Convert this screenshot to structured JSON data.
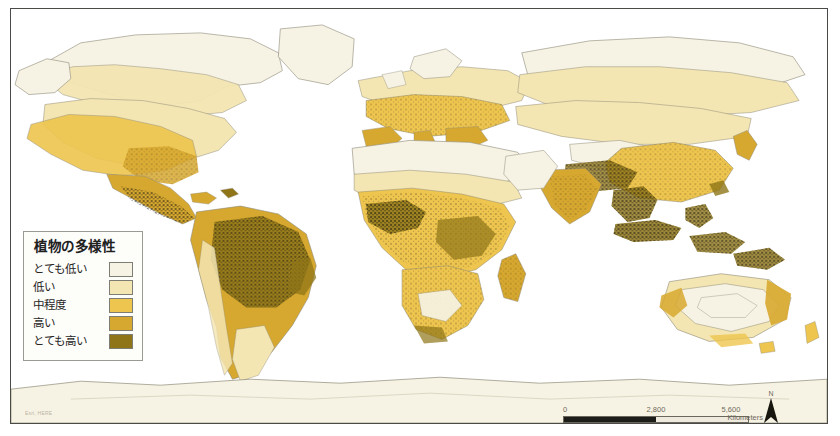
{
  "map": {
    "title": "World Plant Diversity Map",
    "ocean_color": "#ffffff",
    "frame_color": "#4a4a46",
    "coastline_color": "#8d8a78",
    "speckle_color": "#2a2517"
  },
  "legend": {
    "title": "植物の多様性",
    "items": [
      {
        "label": "とても低い",
        "color": "#f7f3e4"
      },
      {
        "label": "低い",
        "color": "#f4e6b2"
      },
      {
        "label": "中程度",
        "color": "#eec54e"
      },
      {
        "label": "高い",
        "color": "#d7a82f"
      },
      {
        "label": "とても高い",
        "color": "#8f7518"
      }
    ]
  },
  "scalebar": {
    "ticks": [
      "0",
      "2,800",
      "5,600"
    ],
    "unit": "Kilometers"
  },
  "north_arrow": {
    "label": "N"
  },
  "credit": {
    "text": "Esri, HERE"
  },
  "regions": {
    "very_low": "#f7f3e4",
    "low": "#f4e6b2",
    "medium": "#eec54e",
    "high": "#d7a82f",
    "very_high": "#8f7518"
  }
}
